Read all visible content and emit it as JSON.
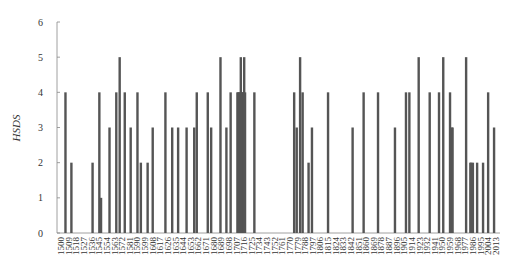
{
  "chart_data": {
    "type": "bar",
    "title": "",
    "xlabel": "",
    "ylabel": "HSDS",
    "ylim": [
      0,
      6
    ],
    "xlim": [
      1500,
      2015
    ],
    "grid": false,
    "legend": null,
    "bar_color": "#555555",
    "y_ticks": [
      0,
      1,
      2,
      3,
      4,
      5,
      6
    ],
    "x_tick_labels": [
      "1500",
      "1509",
      "1518",
      "1527",
      "1536",
      "1545",
      "1554",
      "1563",
      "1572",
      "1581",
      "1590",
      "1599",
      "1608",
      "1617",
      "1626",
      "1635",
      "1644",
      "1653",
      "1662",
      "1671",
      "1680",
      "1689",
      "1698",
      "1707",
      "1716",
      "1725",
      "1734",
      "1743",
      "1752",
      "1761",
      "1770",
      "1779",
      "1788",
      "1797",
      "1806",
      "1815",
      "1824",
      "1833",
      "1842",
      "1851",
      "1860",
      "1869",
      "1878",
      "1887",
      "1896",
      "1905",
      "1914",
      "1923",
      "1932",
      "1941",
      "1950",
      "1959",
      "1968",
      "1977",
      "1986",
      "1995",
      "2004",
      "2013"
    ],
    "points": [
      {
        "year": 1505,
        "value": 4
      },
      {
        "year": 1512,
        "value": 2
      },
      {
        "year": 1537,
        "value": 2
      },
      {
        "year": 1545,
        "value": 4
      },
      {
        "year": 1547,
        "value": 1
      },
      {
        "year": 1557,
        "value": 3
      },
      {
        "year": 1565,
        "value": 4
      },
      {
        "year": 1569,
        "value": 5
      },
      {
        "year": 1575,
        "value": 4
      },
      {
        "year": 1582,
        "value": 3
      },
      {
        "year": 1590,
        "value": 4
      },
      {
        "year": 1594,
        "value": 2
      },
      {
        "year": 1602,
        "value": 2
      },
      {
        "year": 1608,
        "value": 3
      },
      {
        "year": 1623,
        "value": 4
      },
      {
        "year": 1631,
        "value": 3
      },
      {
        "year": 1638,
        "value": 3
      },
      {
        "year": 1648,
        "value": 3
      },
      {
        "year": 1657,
        "value": 3
      },
      {
        "year": 1660,
        "value": 4
      },
      {
        "year": 1673,
        "value": 4
      },
      {
        "year": 1677,
        "value": 3
      },
      {
        "year": 1688,
        "value": 5
      },
      {
        "year": 1695,
        "value": 3
      },
      {
        "year": 1700,
        "value": 4
      },
      {
        "year": 1708,
        "value": 4
      },
      {
        "year": 1709,
        "value": 4
      },
      {
        "year": 1710,
        "value": 4
      },
      {
        "year": 1711,
        "value": 4
      },
      {
        "year": 1712,
        "value": 5
      },
      {
        "year": 1713,
        "value": 4
      },
      {
        "year": 1714,
        "value": 4
      },
      {
        "year": 1715,
        "value": 4
      },
      {
        "year": 1716,
        "value": 5
      },
      {
        "year": 1717,
        "value": 4
      },
      {
        "year": 1728,
        "value": 4
      },
      {
        "year": 1775,
        "value": 4
      },
      {
        "year": 1778,
        "value": 3
      },
      {
        "year": 1782,
        "value": 5
      },
      {
        "year": 1785,
        "value": 4
      },
      {
        "year": 1792,
        "value": 2
      },
      {
        "year": 1796,
        "value": 3
      },
      {
        "year": 1815,
        "value": 4
      },
      {
        "year": 1844,
        "value": 3
      },
      {
        "year": 1857,
        "value": 4
      },
      {
        "year": 1874,
        "value": 4
      },
      {
        "year": 1894,
        "value": 3
      },
      {
        "year": 1907,
        "value": 4
      },
      {
        "year": 1911,
        "value": 4
      },
      {
        "year": 1922,
        "value": 5
      },
      {
        "year": 1935,
        "value": 4
      },
      {
        "year": 1946,
        "value": 4
      },
      {
        "year": 1951,
        "value": 5
      },
      {
        "year": 1959,
        "value": 4
      },
      {
        "year": 1961,
        "value": 3
      },
      {
        "year": 1962,
        "value": 3
      },
      {
        "year": 1978,
        "value": 5
      },
      {
        "year": 1983,
        "value": 2
      },
      {
        "year": 1984,
        "value": 2
      },
      {
        "year": 1986,
        "value": 2
      },
      {
        "year": 1991,
        "value": 2
      },
      {
        "year": 1998,
        "value": 2
      },
      {
        "year": 2004,
        "value": 4
      },
      {
        "year": 2011,
        "value": 3
      }
    ]
  }
}
